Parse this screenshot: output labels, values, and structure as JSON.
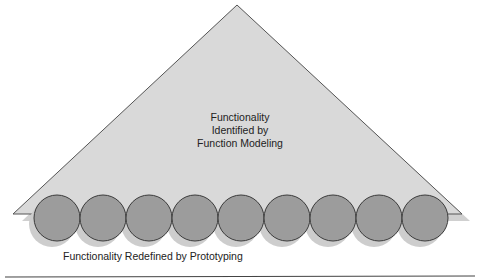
{
  "diagram": {
    "triangle": {
      "label_lines": [
        "Functionality",
        "Identified by",
        "Function Modeling"
      ],
      "fill": "#d9d9d9",
      "shadow": "#b8b8b8",
      "outline": "#555555"
    },
    "circles": {
      "count": 9,
      "fill": "#9c9c9c",
      "shadow": "#cfcfcf",
      "outline": "#3a3a3a"
    },
    "bottom_label": "Functionality Redefined by Prototyping"
  }
}
